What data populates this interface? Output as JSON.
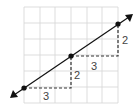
{
  "diagram": {
    "type": "slope-grid",
    "grid": {
      "columns": 6,
      "rows": 6,
      "x0": 24,
      "y0": 7,
      "cell": 15.67,
      "color": "#d4d4d4"
    },
    "line": {
      "color": "#111111",
      "from": [
        10,
        98
      ],
      "to": [
        133,
        14
      ]
    },
    "points": [
      {
        "x": 24,
        "y": 88
      },
      {
        "x": 71,
        "y": 56
      },
      {
        "x": 118,
        "y": 24
      }
    ],
    "steps": [
      {
        "run_label": "3",
        "rise_label": "2"
      },
      {
        "run_label": "3",
        "rise_label": "2"
      }
    ]
  }
}
